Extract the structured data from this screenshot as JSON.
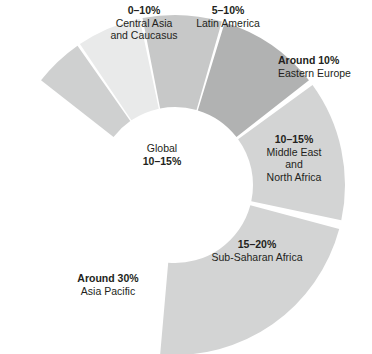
{
  "chart_data": {
    "type": "pie",
    "title": "",
    "subtitle": "",
    "xlabel": "",
    "ylabel": "",
    "legend_position": "none",
    "grid": false,
    "shape": "donut-arc",
    "center_label": {
      "name": "Global",
      "value": "10–15%"
    },
    "slices": [
      {
        "id": "central-asia",
        "name": "Central Asia and Caucasus",
        "name_lines": [
          "Central Asia",
          "and Caucasus"
        ],
        "value": "0–10%",
        "value_bold": true,
        "share": 6,
        "color": "#cfd0d0",
        "start_angle": -52,
        "end_angle": -35
      },
      {
        "id": "latin-america",
        "name": "Latin America",
        "name_lines": [
          "Latin America"
        ],
        "value": "5–10%",
        "value_bold": true,
        "share": 8,
        "color": "#e9eaea",
        "start_angle": -34,
        "end_angle": -12
      },
      {
        "id": "eastern-europe",
        "name": "Eastern Europe",
        "name_lines": [
          "Eastern Europe"
        ],
        "value": "Around 10%",
        "value_bold": true,
        "share": 10,
        "color": "#c7c8c8",
        "start_angle": -11,
        "end_angle": 16
      },
      {
        "id": "mena",
        "name": "Middle East and North Africa",
        "name_lines": [
          "Middle East",
          "and",
          "North Africa"
        ],
        "value": "10–15%",
        "value_bold": true,
        "share": 13,
        "color": "#b1b2b2",
        "start_angle": 17,
        "end_angle": 52
      },
      {
        "id": "sub-saharan-africa",
        "name": "Sub-Saharan Africa",
        "name_lines": [
          "Sub-Saharan Africa"
        ],
        "value": "15–20%",
        "value_bold": true,
        "share": 18,
        "color": "#d3d4d4",
        "start_angle": 54,
        "end_angle": 102
      },
      {
        "id": "asia-pacific",
        "name": "Asia Pacific",
        "name_lines": [
          "Asia Pacific"
        ],
        "value": "Around 30%",
        "value_bold": true,
        "share": 30,
        "color": "#d3d4d4",
        "start_angle": 105,
        "end_angle": 185
      }
    ],
    "geometry": {
      "cx": 175,
      "cy": 185,
      "outer_radius": 170,
      "inner_radius": 78
    },
    "background": "#ffffff",
    "text_color": "#231f20"
  }
}
